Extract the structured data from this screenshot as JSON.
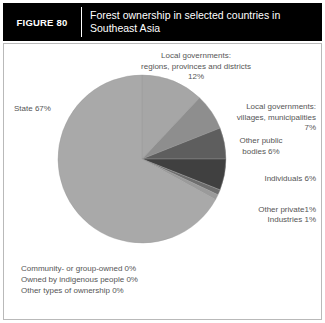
{
  "header": {
    "figure_number": "FIGURE 80",
    "title": "Forest ownership in selected countries in Southeast Asia"
  },
  "labels": {
    "local_regions": "Local governments:\nregions, provinces and districts\n12%",
    "local_villages": "Local governments:\nvillages, municipalities\n7%",
    "other_public": "Other public\nbodies 6%",
    "individuals": "Individuals 6%",
    "other_private": "Other private1%",
    "industries": "Industries 1%",
    "state": "State 67%"
  },
  "footnotes": [
    "Community- or group-owned 0%",
    "Owned by indigenous people 0%",
    "Other types of ownership 0%"
  ],
  "chart_data": {
    "type": "pie",
    "title": "Forest ownership in selected countries in Southeast Asia",
    "unit": "percent",
    "start_angle_deg": 0,
    "direction": "clockwise",
    "legend_position": "callout-labels",
    "grid": false,
    "categories": [
      "Local governments: regions, provinces and districts",
      "Local governments: villages, municipalities",
      "Other public bodies",
      "Individuals",
      "Other private",
      "Industries",
      "State",
      "Community- or group-owned",
      "Owned by indigenous people",
      "Other types of ownership"
    ],
    "values": [
      12,
      7,
      6,
      6,
      1,
      1,
      67,
      0,
      0,
      0
    ],
    "value_labels": [
      "12%",
      "7%",
      "6%",
      "6%",
      "1%",
      "1%",
      "67%",
      "0%",
      "0%",
      "0%"
    ],
    "colors": [
      "#a6a6a6",
      "#8e8e8e",
      "#5e5e5e",
      "#404040",
      "#6e6e6e",
      "#9a9a9a",
      "#a9a9a9",
      "#cccccc",
      "#cccccc",
      "#cccccc"
    ]
  },
  "style": {
    "header_bg": "#000000",
    "header_fg": "#ffffff",
    "panel_border": "#b9b9b9",
    "label_color": "#555555",
    "pie_outline": "#9b9b9b"
  }
}
